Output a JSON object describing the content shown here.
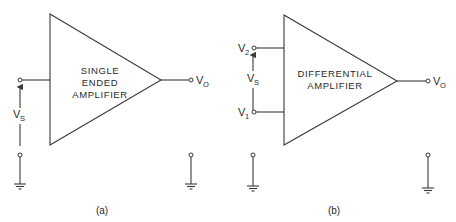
{
  "figure": {
    "panels": [
      {
        "id": "a",
        "caption": "(a)",
        "block_lines": [
          "SINGLE",
          "ENDED",
          "AMPLIFIER"
        ],
        "inputs": [
          {
            "label": "V",
            "sub": "S",
            "role": "source voltage"
          }
        ],
        "output": {
          "label": "V",
          "sub": "O"
        }
      },
      {
        "id": "b",
        "caption": "(b)",
        "block_lines": [
          "DIFFERENTIAL",
          "AMPLIFIER"
        ],
        "inputs": [
          {
            "label": "V",
            "sub": "2"
          },
          {
            "label": "V",
            "sub": "1"
          }
        ],
        "source": {
          "label": "V",
          "sub": "S"
        },
        "output": {
          "label": "V",
          "sub": "O"
        }
      }
    ],
    "colors": {
      "line": "#3a3a3a",
      "text": "#2a2a2a",
      "background": "#ffffff"
    }
  }
}
